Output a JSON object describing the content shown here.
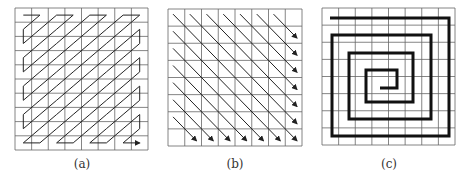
{
  "figure": {
    "panels": [
      {
        "id": "a",
        "caption": "(a)",
        "description": "zigzag scan",
        "cols": 8,
        "rows": 10
      },
      {
        "id": "b",
        "caption": "(b)",
        "description": "diagonal scan",
        "cols": 8,
        "rows": 8
      },
      {
        "id": "c",
        "caption": "(c)",
        "description": "spiral scan",
        "cols": 8,
        "rows": 8
      }
    ]
  },
  "colors": {
    "grid": "#555555",
    "path": "#222222",
    "background": "#ffffff"
  }
}
